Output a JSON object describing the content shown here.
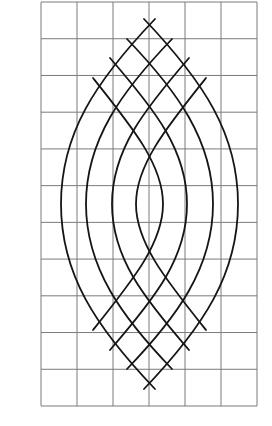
{
  "figure": {
    "background": "#ffffff",
    "grid": {
      "left": 41,
      "top": 2,
      "right": 257,
      "bottom": 406,
      "columns": 6,
      "rows": 11,
      "color": "#7a7a7a"
    },
    "arc_color": "#151515",
    "center_x": 149.5,
    "mirror_y": 204,
    "arcs": [
      {
        "name": "outer",
        "top": [
          144,
          19
        ],
        "cp1": [
          204,
          82
        ],
        "cp2": [
          238,
          134
        ],
        "peak": [
          238,
          204
        ]
      },
      {
        "name": "second",
        "top": [
          127,
          39
        ],
        "cp1": [
          177,
          91
        ],
        "cp2": [
          213,
          140
        ],
        "peak": [
          213,
          204
        ]
      },
      {
        "name": "third",
        "top": [
          110,
          58
        ],
        "cp1": [
          155,
          110
        ],
        "cp2": [
          187,
          150
        ],
        "peak": [
          187,
          204
        ]
      },
      {
        "name": "inner",
        "top": [
          93,
          78
        ],
        "cp1": [
          133,
          128
        ],
        "cp2": [
          163,
          165
        ],
        "peak": [
          163,
          204
        ]
      }
    ]
  }
}
